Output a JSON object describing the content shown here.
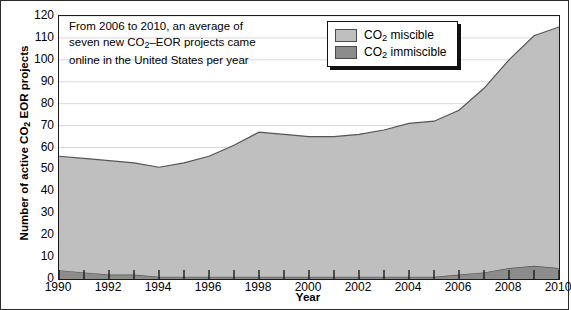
{
  "chart_data": {
    "type": "area",
    "title": "",
    "xlabel": "Year",
    "ylabel": "Number of active CO2 EOR projects",
    "ylabel_parts": {
      "pre": "Number of active CO",
      "sub": "2",
      "post": " EOR projects"
    },
    "stacked": true,
    "grid": "horizontal",
    "legend_position": "top-center-right",
    "xlim": [
      1990,
      2010
    ],
    "ylim": [
      0,
      120
    ],
    "ytick_step": 10,
    "x": [
      1990,
      1991,
      1992,
      1993,
      1994,
      1995,
      1996,
      1997,
      1998,
      1999,
      2000,
      2001,
      2002,
      2003,
      2004,
      2005,
      2006,
      2007,
      2008,
      2009,
      2010
    ],
    "xticks": [
      1990,
      1992,
      1994,
      1996,
      1998,
      2000,
      2002,
      2004,
      2006,
      2008,
      2010
    ],
    "xtick_labels": [
      "1990",
      "1992",
      "1994",
      "1996",
      "1998",
      "2000",
      "2002",
      "2004",
      "2006",
      "2008",
      "2010"
    ],
    "yticks": [
      0,
      10,
      20,
      30,
      40,
      50,
      60,
      70,
      80,
      90,
      100,
      110,
      120
    ],
    "ytick_labels": [
      "0",
      "10",
      "20",
      "30",
      "40",
      "50",
      "60",
      "70",
      "80",
      "90",
      "100",
      "110",
      "120"
    ],
    "series": [
      {
        "name": "CO2 immiscible",
        "label_parts": {
          "pre": "CO",
          "sub": "2",
          "post": " immiscible"
        },
        "color": "#8c8c8c",
        "values": [
          4,
          3,
          2,
          2,
          1,
          1,
          1,
          1,
          1,
          1,
          1,
          1,
          1,
          1,
          1,
          1,
          2,
          3,
          5,
          6,
          5
        ]
      },
      {
        "name": "CO2 miscible",
        "label_parts": {
          "pre": "CO",
          "sub": "2",
          "post": " miscible"
        },
        "color": "#bfbfbf",
        "values": [
          52,
          52,
          52,
          51,
          50,
          52,
          55,
          60,
          66,
          65,
          64,
          64,
          65,
          67,
          70,
          71,
          75,
          84,
          95,
          105,
          110
        ]
      }
    ],
    "annotation": {
      "lines": [
        {
          "pre": "From 2006 to 2010, an average of",
          "sub": "",
          "post": ""
        },
        {
          "pre": "seven new CO",
          "sub": "2",
          "post": "–EOR projects came"
        },
        {
          "pre": "online in the United States per year",
          "sub": "",
          "post": ""
        }
      ]
    },
    "colors": {
      "miscible": "#bfbfbf",
      "immiscible": "#8c8c8c",
      "grid": "#d9d9d9",
      "axis": "#1a1a1a",
      "line": "#555555"
    }
  }
}
